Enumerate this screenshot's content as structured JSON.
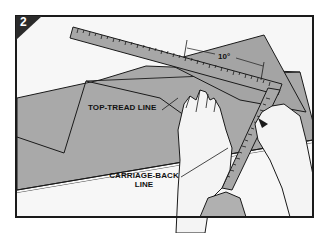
{
  "figure": {
    "step_number": "2",
    "labels": {
      "top_tread_line": "TOP-TREAD LINE",
      "carriage_back_line_1": "CARRIAGE-BACK",
      "carriage_back_line_2": "LINE",
      "angle": "10°"
    },
    "colors": {
      "frame": "#1a1a1a",
      "background": "#f7f7f7",
      "stock_gray": "#a9a9a9",
      "square_gray": "#a4a4a4",
      "badge": "#2b2b2b",
      "skin": "#f4f4f4"
    }
  }
}
